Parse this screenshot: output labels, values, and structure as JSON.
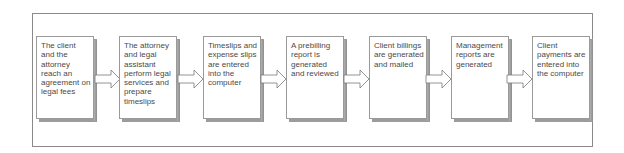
{
  "diagram": {
    "type": "process-flow",
    "steps": [
      {
        "label": "The client and the attorney reach an agreement on legal fees"
      },
      {
        "label": "The attorney and legal assistant perform legal services and prepare timeslips"
      },
      {
        "label": "Timeslips and expense slips are entered into the computer"
      },
      {
        "label": "A prebilling report is generated and reviewed"
      },
      {
        "label": "Client billings are generated and mailed"
      },
      {
        "label": "Management reports are generated"
      },
      {
        "label": "Client payments are entered into the computer"
      }
    ],
    "connector": "right-arrow-icon",
    "colors": {
      "border": "#8a8a8a",
      "shadow": "#9c9c9c",
      "text": "#4a4a4a",
      "background": "#ffffff"
    }
  }
}
